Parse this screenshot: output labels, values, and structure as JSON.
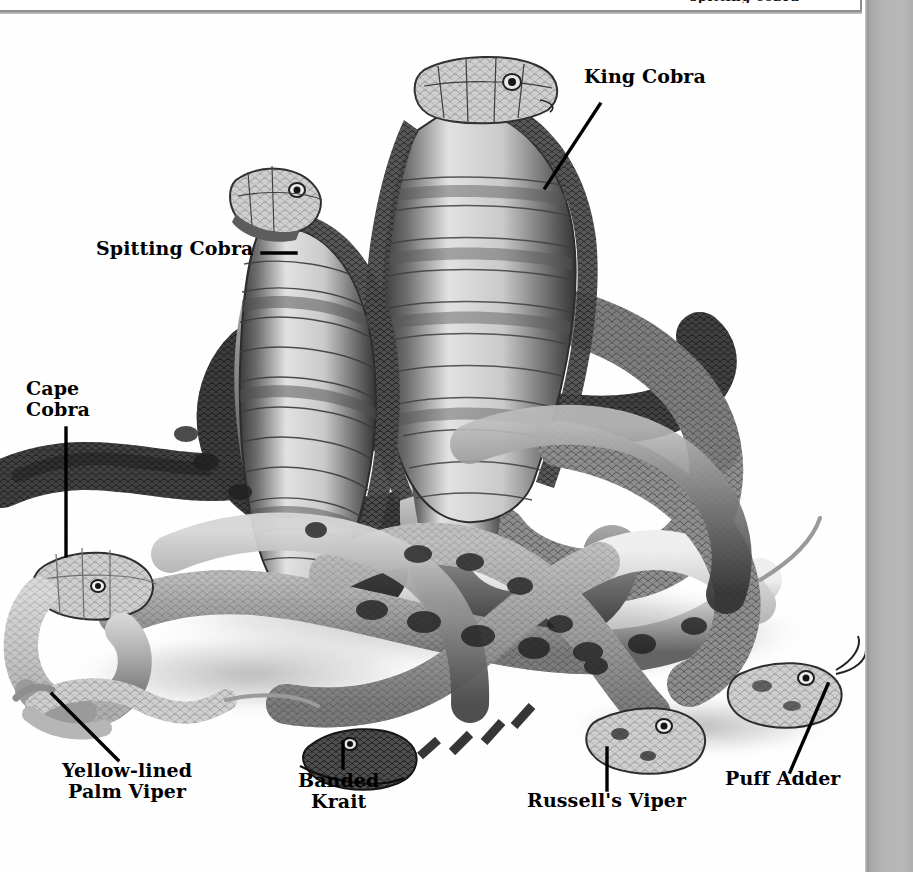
{
  "page": {
    "kind": "scanned-book-plate",
    "background_color": "#ffffff",
    "gutter_color": "#b4b4b4",
    "ink_color": "#000000"
  },
  "top_panel": {
    "present": true,
    "border_color": "#8d8d8d",
    "clipped_text": "spitting cobra"
  },
  "illustration": {
    "title": "Venomous snakes group plate",
    "style": "grayscale scraperboard / pen-and-ink natural history illustration",
    "subjects": [
      "King Cobra",
      "Spitting Cobra",
      "Cape Cobra",
      "Yellow-lined Palm Viper",
      "Banded Krait",
      "Russell's Viper",
      "Puff Adder"
    ]
  },
  "labels": [
    {
      "id": "king-cobra",
      "text": "King Cobra",
      "lines": [
        "King Cobra"
      ],
      "align": "left"
    },
    {
      "id": "spitting-cobra",
      "text": "Spitting Cobra",
      "lines": [
        "Spitting Cobra"
      ],
      "align": "left"
    },
    {
      "id": "cape-cobra",
      "text": "Cape\nCobra",
      "lines": [
        "Cape",
        "Cobra"
      ],
      "align": "left"
    },
    {
      "id": "yellow-lined-palm-viper",
      "text": "Yellow-lined\nPalm Viper",
      "lines": [
        "Yellow-lined",
        "Palm Viper"
      ],
      "align": "center"
    },
    {
      "id": "banded-krait",
      "text": "Banded\nKrait",
      "lines": [
        "Banded",
        "Krait"
      ],
      "align": "center"
    },
    {
      "id": "russells-viper",
      "text": "Russell's Viper",
      "lines": [
        "Russell's Viper"
      ],
      "align": "center"
    },
    {
      "id": "puff-adder",
      "text": "Puff Adder",
      "lines": [
        "Puff Adder"
      ],
      "align": "center"
    }
  ],
  "leaders": [
    {
      "id": "king-cobra-leader",
      "type": "diagonal"
    },
    {
      "id": "spitting-cobra-leader",
      "type": "horizontal"
    },
    {
      "id": "cape-cobra-leader",
      "type": "vertical"
    },
    {
      "id": "yellow-lined-palm-viper-leader",
      "type": "diagonal"
    },
    {
      "id": "banded-krait-leader",
      "type": "vertical"
    },
    {
      "id": "russells-viper-leader",
      "type": "vertical"
    },
    {
      "id": "puff-adder-leader",
      "type": "diagonal"
    }
  ]
}
